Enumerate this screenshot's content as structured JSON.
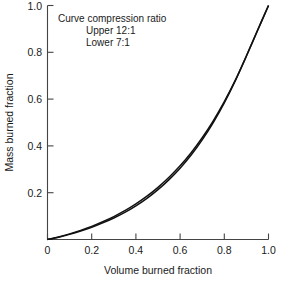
{
  "chart_data": {
    "type": "line",
    "title": "",
    "xlabel": "Volume burned fraction",
    "ylabel": "Mass burned fraction",
    "xlim": [
      0,
      1.0
    ],
    "ylim": [
      0,
      1.0
    ],
    "grid": false,
    "legend_position": "none",
    "xticks": [
      "0",
      "0.2",
      "0.4",
      "0.6",
      "0.8",
      "1.0"
    ],
    "xtick_values": [
      0,
      0.2,
      0.4,
      0.6,
      0.8,
      1.0
    ],
    "yticks": [
      "0.2",
      "0.4",
      "0.6",
      "0.8",
      "1.0"
    ],
    "ytick_values": [
      0.2,
      0.4,
      0.6,
      0.8,
      1.0
    ],
    "annotations": [
      "Curve compression ratio",
      "Upper 12:1",
      "Lower  7:1"
    ],
    "x": [
      0,
      0.05,
      0.1,
      0.15,
      0.2,
      0.25,
      0.3,
      0.35,
      0.4,
      0.45,
      0.5,
      0.55,
      0.6,
      0.65,
      0.7,
      0.75,
      0.8,
      0.85,
      0.9,
      0.95,
      1.0
    ],
    "series": [
      {
        "name": "Upper 12:1",
        "compression_ratio": "12:1",
        "values": [
          0,
          0.011,
          0.024,
          0.039,
          0.056,
          0.076,
          0.098,
          0.123,
          0.152,
          0.185,
          0.223,
          0.266,
          0.315,
          0.371,
          0.435,
          0.507,
          0.589,
          0.681,
          0.784,
          0.892,
          1.0
        ]
      },
      {
        "name": "Lower 7:1",
        "compression_ratio": "7:1",
        "values": [
          0,
          0.01,
          0.022,
          0.036,
          0.052,
          0.071,
          0.092,
          0.116,
          0.144,
          0.176,
          0.213,
          0.256,
          0.305,
          0.361,
          0.426,
          0.5,
          0.584,
          0.679,
          0.784,
          0.893,
          1.0
        ]
      }
    ]
  },
  "figure": {
    "background_color": "#ffffff",
    "curve_color": "#111111",
    "axis_color": "#444444"
  }
}
